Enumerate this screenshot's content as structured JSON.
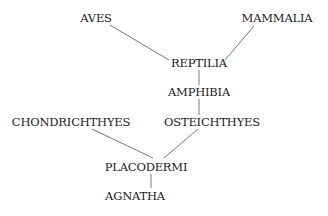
{
  "diagram": {
    "type": "phylogenetic-tree",
    "nodes": [
      {
        "id": "aves",
        "label": "AVES",
        "x": 96,
        "y": 18
      },
      {
        "id": "mammalia",
        "label": "MAMMALIA",
        "x": 277,
        "y": 18
      },
      {
        "id": "reptilia",
        "label": "REPTILIA",
        "x": 199,
        "y": 63
      },
      {
        "id": "amphibia",
        "label": "AMPHIBIA",
        "x": 199,
        "y": 92
      },
      {
        "id": "chondrichthyes",
        "label": "CHONDRICHTHYES",
        "x": 71,
        "y": 122
      },
      {
        "id": "osteichthyes",
        "label": "OSTEICHTHYES",
        "x": 212,
        "y": 122
      },
      {
        "id": "placodermi",
        "label": "PLACODERMI",
        "x": 146,
        "y": 167
      },
      {
        "id": "agnatha",
        "label": "AGNATHA",
        "x": 135,
        "y": 196
      }
    ],
    "edges": [
      {
        "from": "aves",
        "to": "reptilia"
      },
      {
        "from": "mammalia",
        "to": "reptilia"
      },
      {
        "from": "reptilia",
        "to": "amphibia"
      },
      {
        "from": "amphibia",
        "to": "osteichthyes"
      },
      {
        "from": "chondrichthyes",
        "to": "placodermi"
      },
      {
        "from": "osteichthyes",
        "to": "placodermi"
      },
      {
        "from": "placodermi",
        "to": "agnatha"
      }
    ],
    "line_color": "#555555"
  }
}
